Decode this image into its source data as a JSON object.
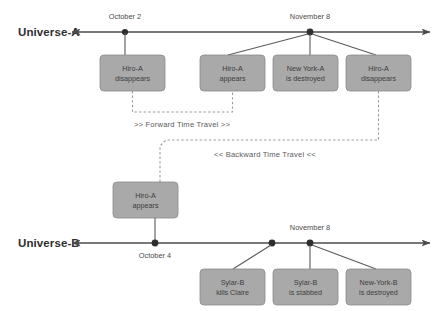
{
  "diagram": {
    "title_universe_a": "Universe-A",
    "title_universe_b": "Universe-B",
    "accent_box_fill": "#a9a9a9",
    "accent_box_stroke": "#8a8a8a",
    "line_color": "#4b4b4b",
    "dashed_color": "#9a9a9a"
  },
  "universe_a": {
    "label": "Universe-A",
    "timeline_markers": [
      {
        "date": "October 2",
        "x": 125
      },
      {
        "date": "November 8",
        "x": 310
      }
    ],
    "events": [
      {
        "line1": "Hiro-A",
        "line2": "disappears",
        "x": 100,
        "y": 55
      },
      {
        "line1": "Hiro-A",
        "line2": "appears",
        "x": 200,
        "y": 55
      },
      {
        "line1": "New York-A",
        "line2": "is destroyed",
        "x": 273,
        "y": 55
      },
      {
        "line1": "Hiro-A",
        "line2": "disappears",
        "x": 346,
        "y": 55
      }
    ]
  },
  "universe_b": {
    "label": "Universe-B",
    "timeline_markers": [
      {
        "date": "October 4",
        "x": 155
      },
      {
        "date": "November 8",
        "x": 310
      }
    ],
    "events": [
      {
        "line1": "Hiro-A",
        "line2": "appears",
        "x": 113,
        "y": 182
      },
      {
        "line1": "Sylar-B",
        "line2": "kills Claire",
        "x": 200,
        "y": 269
      },
      {
        "line1": "Sylar-B",
        "line2": "is stabbed",
        "x": 273,
        "y": 269
      },
      {
        "line1": "New-York-B",
        "line2": "is destroyed",
        "x": 346,
        "y": 269
      }
    ]
  },
  "travel_labels": {
    "forward": ">> Forward Time Travel >>",
    "backward": "<< Backward Time Travel <<"
  }
}
